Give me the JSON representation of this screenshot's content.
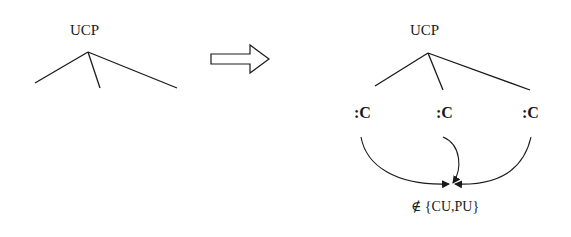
{
  "diagram": {
    "left_tree": {
      "root_label": "UCP",
      "branches": 3
    },
    "transform_arrow": {
      "icon": "right-block-arrow-icon"
    },
    "right_tree": {
      "root_label": "UCP",
      "children": [
        {
          "label": ":C"
        },
        {
          "label": ":C"
        },
        {
          "label": ":C"
        }
      ],
      "constraint_label": "∉ {CU,PU}"
    },
    "colors": {
      "stroke": "#1a1a1a",
      "background": "#ffffff"
    }
  }
}
